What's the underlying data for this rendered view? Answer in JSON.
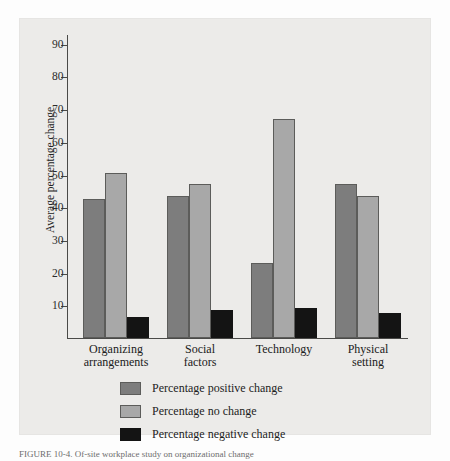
{
  "chart_data": {
    "type": "bar",
    "title": "",
    "xlabel": "",
    "ylabel": "Average percentage change",
    "ylim": [
      0,
      93
    ],
    "yticks": [
      10,
      20,
      30,
      40,
      50,
      60,
      70,
      80,
      90
    ],
    "ytick_labels": [
      "10",
      "20",
      "30",
      "40",
      "50",
      "60",
      "70",
      "80",
      "90"
    ],
    "grid": false,
    "legend_position": "below-left",
    "categories": [
      "Organizing arrangements",
      "Social factors",
      "Technology",
      "Physical setting"
    ],
    "category_lines": [
      [
        "Organizing",
        "arrangements"
      ],
      [
        "Social",
        "factors"
      ],
      [
        "Technology"
      ],
      [
        "Physical",
        "setting"
      ]
    ],
    "series": [
      {
        "name": "Percentage positive change",
        "color": "#7d7d7d",
        "values": [
          42.5,
          43.5,
          23.0,
          47.0
        ]
      },
      {
        "name": "Percentage no change",
        "color": "#a8a8a8",
        "values": [
          50.5,
          47.0,
          67.0,
          43.5
        ]
      },
      {
        "name": "Percentage negative change",
        "color": "#141414",
        "values": [
          6.3,
          8.5,
          9.3,
          7.5
        ]
      }
    ]
  },
  "figure": {
    "caption": "FIGURE 10-4.   Of-site workplace study on organizational change",
    "panel_background": "#ecebe9",
    "axis_color": "#4a4a48"
  }
}
